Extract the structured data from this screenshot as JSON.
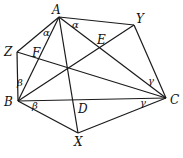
{
  "diagram": {
    "type": "geometry",
    "points": {
      "A": {
        "label": "A",
        "x": 59,
        "y": 17,
        "lx": 52,
        "ly": 14
      },
      "Y": {
        "label": "Y",
        "x": 134,
        "y": 25,
        "lx": 136,
        "ly": 23
      },
      "Z": {
        "label": "Z",
        "x": 17,
        "y": 52,
        "lx": 4,
        "ly": 56
      },
      "B": {
        "label": "B",
        "x": 18,
        "y": 101,
        "lx": 4,
        "ly": 106
      },
      "C": {
        "label": "C",
        "x": 166,
        "y": 98,
        "lx": 170,
        "ly": 104
      },
      "X": {
        "label": "X",
        "x": 78,
        "y": 133,
        "lx": 74,
        "ly": 146
      },
      "D": {
        "label": "D",
        "x": 75,
        "y": 100,
        "lx": 78,
        "ly": 113
      },
      "E": {
        "label": "E",
        "x": 100,
        "y": 46,
        "lx": 98,
        "ly": 44
      },
      "F": {
        "label": "F",
        "x": 38,
        "y": 57,
        "lx": 32,
        "ly": 56
      }
    },
    "segments": [
      [
        "A",
        "Y"
      ],
      [
        "Y",
        "C"
      ],
      [
        "A",
        "Z"
      ],
      [
        "Z",
        "B"
      ],
      [
        "B",
        "X"
      ],
      [
        "X",
        "C"
      ],
      [
        "B",
        "C"
      ],
      [
        "A",
        "X"
      ],
      [
        "A",
        "C"
      ],
      [
        "B",
        "A"
      ],
      [
        "B",
        "Y"
      ],
      [
        "Z",
        "C"
      ]
    ],
    "angle_labels": [
      {
        "symbol": "α",
        "x": 73,
        "y": 27
      },
      {
        "symbol": "α",
        "x": 44,
        "y": 35
      },
      {
        "symbol": "β",
        "x": 18,
        "y": 85
      },
      {
        "symbol": "β",
        "x": 42,
        "y": 112
      },
      {
        "symbol": "γ",
        "x": 150,
        "y": 84
      },
      {
        "symbol": "γ",
        "x": 140,
        "y": 107
      }
    ],
    "labels": {
      "A": "A",
      "Y": "Y",
      "Z": "Z",
      "B": "B",
      "C": "C",
      "X": "X",
      "D": "D",
      "E": "E",
      "F": "F"
    },
    "greek": {
      "alpha": "α",
      "beta": "β",
      "gamma": "γ"
    }
  }
}
